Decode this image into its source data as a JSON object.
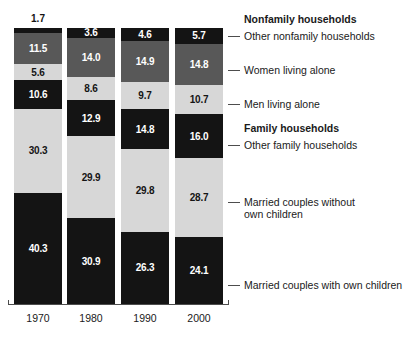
{
  "chart_data": {
    "type": "bar",
    "subtype": "stacked-bar-100",
    "title": "",
    "xlabel": "",
    "ylabel": "",
    "grid": false,
    "legend_position": "right-with-leader-lines",
    "ylim": [
      0,
      100
    ],
    "categories": [
      "1970",
      "1980",
      "1990",
      "2000"
    ],
    "series": [
      {
        "name": "Other nonfamily households",
        "color": "#141414",
        "values": [
          1.7,
          3.6,
          4.6,
          5.7
        ]
      },
      {
        "name": "Women living alone",
        "color": "#585858",
        "values": [
          11.5,
          14.0,
          14.9,
          14.8
        ]
      },
      {
        "name": "Men living alone",
        "color": "#d7d7d7",
        "values": [
          5.6,
          8.6,
          9.7,
          10.7
        ]
      },
      {
        "name": "Other family households",
        "color": "#141414",
        "values": [
          10.6,
          12.9,
          14.8,
          16.0
        ]
      },
      {
        "name": "Married couples without own children",
        "color": "#d7d7d7",
        "values": [
          30.3,
          29.9,
          29.8,
          28.7
        ]
      },
      {
        "name": "Married couples with own children",
        "color": "#141414",
        "values": [
          40.3,
          30.9,
          26.3,
          24.1
        ]
      }
    ],
    "group_headings": [
      "Nonfamily households",
      "Family households"
    ],
    "annotations": [
      "1.7 label placed outside bar above 1970 column"
    ]
  },
  "axis": {
    "years": [
      "1970",
      "1980",
      "1990",
      "2000"
    ]
  },
  "bars": [
    {
      "year": "1970",
      "segments": [
        {
          "value": "1.7",
          "tone": "dark",
          "outside": true
        },
        {
          "value": "11.5",
          "tone": "mid",
          "outside": false
        },
        {
          "value": "5.6",
          "tone": "light",
          "outside": false
        },
        {
          "value": "10.6",
          "tone": "dark",
          "outside": false
        },
        {
          "value": "30.3",
          "tone": "light",
          "outside": false
        },
        {
          "value": "40.3",
          "tone": "dark",
          "outside": false
        }
      ]
    },
    {
      "year": "1980",
      "segments": [
        {
          "value": "3.6",
          "tone": "dark",
          "outside": false
        },
        {
          "value": "14.0",
          "tone": "mid",
          "outside": false
        },
        {
          "value": "8.6",
          "tone": "light",
          "outside": false
        },
        {
          "value": "12.9",
          "tone": "dark",
          "outside": false
        },
        {
          "value": "29.9",
          "tone": "light",
          "outside": false
        },
        {
          "value": "30.9",
          "tone": "dark",
          "outside": false
        }
      ]
    },
    {
      "year": "1990",
      "segments": [
        {
          "value": "4.6",
          "tone": "dark",
          "outside": false
        },
        {
          "value": "14.9",
          "tone": "mid",
          "outside": false
        },
        {
          "value": "9.7",
          "tone": "light",
          "outside": false
        },
        {
          "value": "14.8",
          "tone": "dark",
          "outside": false
        },
        {
          "value": "29.8",
          "tone": "light",
          "outside": false
        },
        {
          "value": "26.3",
          "tone": "dark",
          "outside": false
        }
      ]
    },
    {
      "year": "2000",
      "segments": [
        {
          "value": "5.7",
          "tone": "dark",
          "outside": false
        },
        {
          "value": "14.8",
          "tone": "mid",
          "outside": false
        },
        {
          "value": "10.7",
          "tone": "light",
          "outside": false
        },
        {
          "value": "16.0",
          "tone": "dark",
          "outside": false
        },
        {
          "value": "28.7",
          "tone": "light",
          "outside": false
        },
        {
          "value": "24.1",
          "tone": "dark",
          "outside": false
        }
      ]
    }
  ],
  "legend": {
    "items": [
      {
        "text": "Nonfamily households",
        "bold": true,
        "leader": false,
        "y": 14,
        "lines": 1
      },
      {
        "text": "Other nonfamily households",
        "bold": false,
        "leader": true,
        "y": 31,
        "lines": 1
      },
      {
        "text": "Women living alone",
        "bold": false,
        "leader": true,
        "y": 65,
        "lines": 1
      },
      {
        "text": "Men living alone",
        "bold": false,
        "leader": true,
        "y": 99,
        "lines": 1
      },
      {
        "text": "Family households",
        "bold": true,
        "leader": false,
        "y": 123,
        "lines": 1
      },
      {
        "text": "Other family households",
        "bold": false,
        "leader": true,
        "y": 140,
        "lines": 1
      },
      {
        "text": "Married couples without\nown children",
        "bold": false,
        "leader": true,
        "y": 197,
        "lines": 2
      },
      {
        "text": "Married couples with own children",
        "bold": false,
        "leader": true,
        "y": 280,
        "lines": 1
      }
    ]
  },
  "colors": {
    "dark": "#141414",
    "mid": "#585858",
    "light": "#d7d7d7",
    "axis": "#4d4d4d",
    "background": "#ffffff"
  }
}
